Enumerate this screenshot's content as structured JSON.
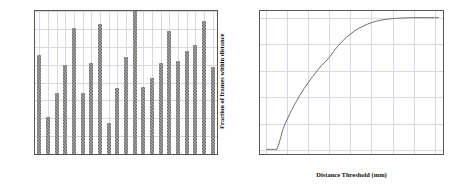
{
  "figure": {
    "background": "#ffffff",
    "foreground": "#1a1a1a",
    "grid_color": "#d8d8e4",
    "bar_color": "#6e6e6e",
    "line_color": "#707070"
  },
  "chart_data": [
    {
      "type": "bar",
      "title": "",
      "xlabel": "",
      "ylabel": "Mean Error (mm)",
      "ylim": [
        0,
        16
      ],
      "yticks": [
        0,
        2,
        4,
        6,
        8,
        10,
        12,
        14,
        16
      ],
      "ytick_labels": [
        "0",
        "2",
        "4",
        "6",
        "8",
        "10",
        "12",
        "14",
        "16"
      ],
      "grid": true,
      "legend": "none",
      "categories": [
        "C",
        "T1",
        "T2",
        "T3",
        "T4",
        "I2",
        "I3",
        "I4",
        "M1",
        "M2",
        "M3",
        "M4",
        "R1",
        "R2",
        "R3",
        "R4",
        "P1",
        "P2",
        "P3",
        "P4",
        "Mean"
      ],
      "values": [
        11.1,
        4.1,
        6.8,
        10.0,
        14.1,
        6.8,
        10.2,
        14.5,
        3.5,
        7.4,
        10.9,
        16.0,
        7.55,
        8.5,
        10.2,
        13.8,
        10.45,
        11.5,
        12.15,
        14.9,
        9.7
      ]
    },
    {
      "type": "line",
      "title": "",
      "xlabel": "Distance Threshold (mm)",
      "ylabel": "Fraction of frames within distance",
      "xlim": [
        -3,
        84
      ],
      "ylim": [
        -0.03,
        1.05
      ],
      "xticks": [
        0,
        10,
        20,
        30,
        40,
        50,
        60,
        70,
        80
      ],
      "xtick_labels": [
        "0",
        "10",
        "20",
        "30",
        "40",
        "50",
        "60",
        "70",
        "80"
      ],
      "yticks": [
        0.0,
        0.2,
        0.4,
        0.6,
        0.8,
        1.0
      ],
      "ytick_labels": [
        "0.0",
        "0.2",
        "0.4",
        "0.6",
        "0.8",
        "1.0"
      ],
      "grid": true,
      "legend": "none",
      "x": [
        0,
        2,
        4,
        5,
        6,
        7,
        8,
        9,
        10,
        12,
        14,
        16,
        18,
        20,
        22,
        24,
        26,
        28,
        30,
        32,
        34,
        36,
        38,
        40,
        42,
        44,
        46,
        48,
        50,
        52,
        54,
        56,
        58,
        60,
        62,
        64,
        66,
        68,
        70,
        72,
        74,
        76,
        78,
        80,
        82
      ],
      "y": [
        0.005,
        0.005,
        0.005,
        0.005,
        0.045,
        0.105,
        0.16,
        0.2,
        0.235,
        0.3,
        0.36,
        0.415,
        0.465,
        0.51,
        0.555,
        0.595,
        0.635,
        0.665,
        0.7,
        0.745,
        0.785,
        0.82,
        0.85,
        0.875,
        0.9,
        0.92,
        0.935,
        0.95,
        0.962,
        0.972,
        0.979,
        0.985,
        0.989,
        0.992,
        0.995,
        0.997,
        0.998,
        0.999,
        1.0,
        1.0,
        1.0,
        1.0,
        1.0,
        1.0,
        1.0
      ]
    }
  ]
}
